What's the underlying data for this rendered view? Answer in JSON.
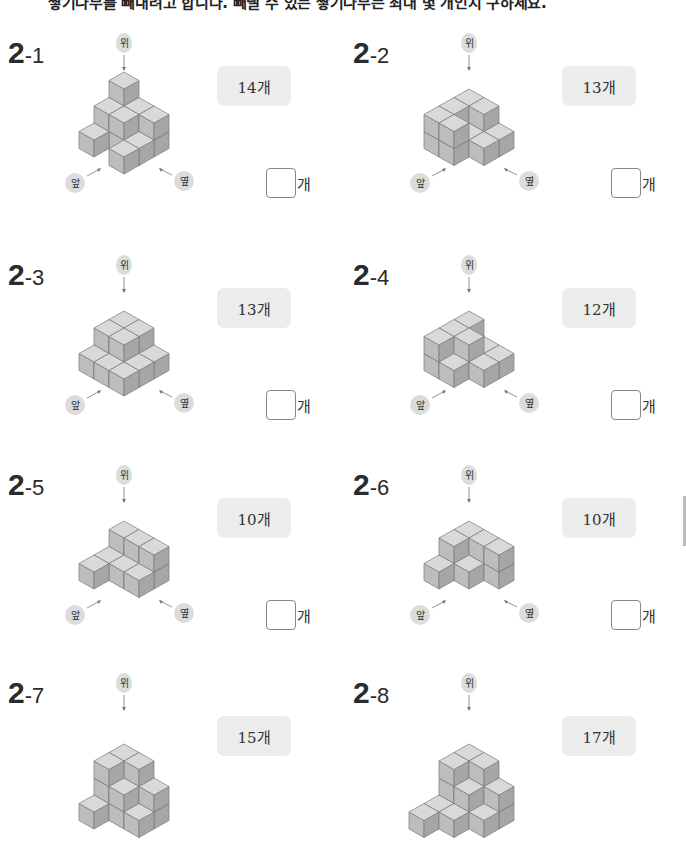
{
  "instruction": "쌓기나무를 빼내려고 합니다. 빼낼 수 있는 쌓기나무는 최대 몇 개인지 구하세요.",
  "labels": {
    "top": "위",
    "front": "앞",
    "side": "옆"
  },
  "answer_unit": "개",
  "colors": {
    "top": "#d9d9d9",
    "left": "#bdbdbd",
    "right": "#a6a6a6",
    "edge": "#7a7a7a",
    "badge": "#ececec",
    "label_bg": "#dcdcdc"
  },
  "problems": [
    {
      "id": "2-1",
      "num_big": "2",
      "num_small": "-1",
      "given": "14개",
      "answer": "",
      "cubes": [
        [
          0,
          0,
          0
        ],
        [
          0,
          1,
          0
        ],
        [
          0,
          2,
          0
        ],
        [
          1,
          0,
          0
        ],
        [
          1,
          1,
          0
        ],
        [
          1,
          2,
          0
        ],
        [
          2,
          0,
          0
        ],
        [
          2,
          2,
          0
        ],
        [
          0,
          0,
          1
        ],
        [
          0,
          1,
          1
        ],
        [
          1,
          0,
          1
        ],
        [
          1,
          1,
          1
        ],
        [
          0,
          2,
          1
        ],
        [
          0,
          0,
          2
        ]
      ]
    },
    {
      "id": "2-2",
      "num_big": "2",
      "num_small": "-2",
      "given": "13개",
      "answer": "",
      "cubes": [
        [
          0,
          0,
          0
        ],
        [
          1,
          0,
          0
        ],
        [
          2,
          0,
          0
        ],
        [
          0,
          1,
          0
        ],
        [
          1,
          1,
          0
        ],
        [
          2,
          1,
          0
        ],
        [
          0,
          2,
          0
        ],
        [
          1,
          2,
          0
        ],
        [
          0,
          0,
          1
        ],
        [
          1,
          0,
          1
        ],
        [
          2,
          0,
          1
        ],
        [
          0,
          1,
          1
        ],
        [
          2,
          1,
          1
        ]
      ]
    },
    {
      "id": "2-3",
      "num_big": "2",
      "num_small": "-3",
      "given": "13개",
      "answer": "",
      "cubes": [
        [
          0,
          0,
          0
        ],
        [
          1,
          0,
          0
        ],
        [
          2,
          0,
          0
        ],
        [
          0,
          1,
          0
        ],
        [
          1,
          1,
          0
        ],
        [
          2,
          1,
          0
        ],
        [
          0,
          2,
          0
        ],
        [
          1,
          2,
          0
        ],
        [
          2,
          2,
          0
        ],
        [
          0,
          0,
          1
        ],
        [
          1,
          0,
          1
        ],
        [
          0,
          1,
          1
        ],
        [
          1,
          1,
          1
        ]
      ]
    },
    {
      "id": "2-4",
      "num_big": "2",
      "num_small": "-4",
      "given": "12개",
      "answer": "",
      "cubes": [
        [
          0,
          0,
          0
        ],
        [
          1,
          0,
          0
        ],
        [
          2,
          0,
          0
        ],
        [
          0,
          1,
          0
        ],
        [
          1,
          1,
          0
        ],
        [
          2,
          1,
          0
        ],
        [
          0,
          2,
          0
        ],
        [
          1,
          2,
          0
        ],
        [
          0,
          0,
          1
        ],
        [
          1,
          0,
          1
        ],
        [
          2,
          0,
          1
        ],
        [
          1,
          1,
          1
        ]
      ]
    },
    {
      "id": "2-5",
      "num_big": "2",
      "num_small": "-5",
      "given": "10개",
      "answer": "",
      "cubes": [
        [
          0,
          0,
          0
        ],
        [
          1,
          0,
          0
        ],
        [
          0,
          1,
          0
        ],
        [
          1,
          1,
          0
        ],
        [
          0,
          2,
          0
        ],
        [
          1,
          2,
          0
        ],
        [
          2,
          0,
          0
        ],
        [
          0,
          0,
          1
        ],
        [
          0,
          1,
          1
        ],
        [
          0,
          2,
          1
        ]
      ]
    },
    {
      "id": "2-6",
      "num_big": "2",
      "num_small": "-6",
      "given": "10개",
      "answer": "",
      "cubes": [
        [
          0,
          0,
          0
        ],
        [
          1,
          0,
          0
        ],
        [
          0,
          1,
          0
        ],
        [
          1,
          1,
          0
        ],
        [
          0,
          2,
          0
        ],
        [
          2,
          0,
          0
        ],
        [
          0,
          0,
          1
        ],
        [
          1,
          0,
          1
        ],
        [
          0,
          1,
          1
        ],
        [
          0,
          2,
          1
        ]
      ]
    },
    {
      "id": "2-7",
      "num_big": "2",
      "num_small": "-7",
      "given": "15개",
      "answer": "",
      "cubes": [
        [
          0,
          0,
          0
        ],
        [
          1,
          0,
          0
        ],
        [
          2,
          0,
          0
        ],
        [
          0,
          1,
          0
        ],
        [
          1,
          1,
          0
        ],
        [
          0,
          2,
          0
        ],
        [
          1,
          2,
          0
        ],
        [
          0,
          0,
          1
        ],
        [
          1,
          0,
          1
        ],
        [
          0,
          1,
          1
        ],
        [
          1,
          1,
          1
        ],
        [
          0,
          2,
          1
        ],
        [
          0,
          0,
          2
        ],
        [
          0,
          1,
          2
        ],
        [
          1,
          0,
          2
        ]
      ]
    },
    {
      "id": "2-8",
      "num_big": "2",
      "num_small": "-8",
      "given": "17개",
      "answer": "",
      "cubes": [
        [
          0,
          0,
          0
        ],
        [
          1,
          0,
          0
        ],
        [
          2,
          0,
          0
        ],
        [
          3,
          0,
          0
        ],
        [
          0,
          1,
          0
        ],
        [
          1,
          1,
          0
        ],
        [
          2,
          1,
          0
        ],
        [
          0,
          2,
          0
        ],
        [
          1,
          2,
          0
        ],
        [
          0,
          0,
          1
        ],
        [
          1,
          0,
          1
        ],
        [
          0,
          1,
          1
        ],
        [
          1,
          1,
          1
        ],
        [
          0,
          2,
          1
        ],
        [
          0,
          0,
          2
        ],
        [
          1,
          0,
          2
        ],
        [
          0,
          1,
          2
        ]
      ]
    }
  ]
}
